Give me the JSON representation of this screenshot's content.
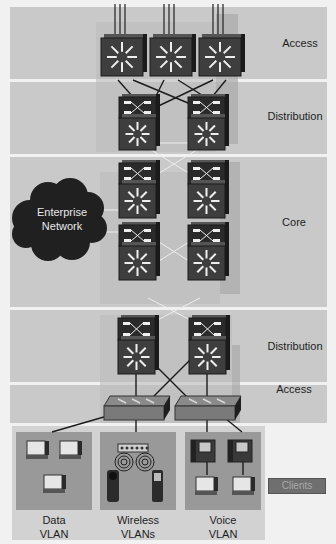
{
  "layers": [
    {
      "id": "access-top",
      "label": "Access"
    },
    {
      "id": "distribution-top",
      "label": "Distribution"
    },
    {
      "id": "core",
      "label": "Core"
    },
    {
      "id": "distribution-bottom",
      "label": "Distribution"
    },
    {
      "id": "access-bottom",
      "label": "Access"
    }
  ],
  "cloud": {
    "label_line1": "Enterprise",
    "label_line2": "Network"
  },
  "client_groups": [
    {
      "line1": "Data",
      "line2": "VLAN"
    },
    {
      "line1": "Wireless",
      "line2": "VLANs"
    },
    {
      "line1": "Voice",
      "line2": "VLAN"
    }
  ],
  "legend": {
    "clients_label": "Clients"
  },
  "colors": {
    "band": "#c9c9c9",
    "device": "#2b2b2b",
    "device_face": "#3e3e3e",
    "arrow": "#eeeeee",
    "client_box": "#999999",
    "cloud": "#202020"
  }
}
